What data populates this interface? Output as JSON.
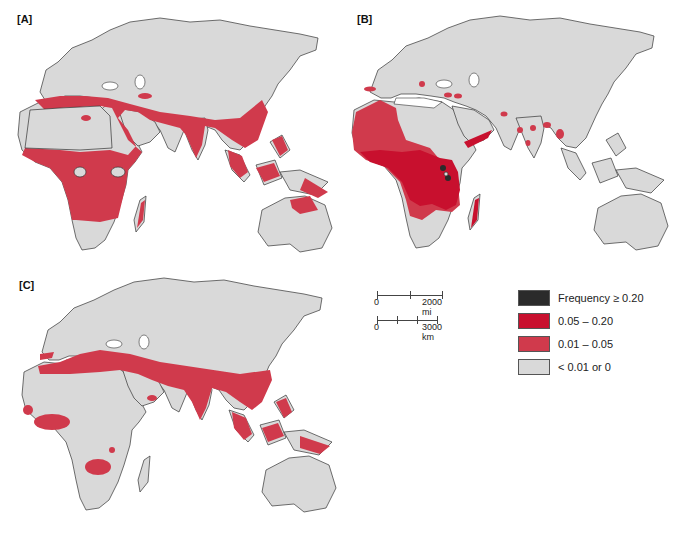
{
  "figure": {
    "panels": [
      {
        "id": "A",
        "label": "[A]"
      },
      {
        "id": "B",
        "label": "[B]"
      },
      {
        "id": "C",
        "label": "[C]"
      }
    ]
  },
  "legend": {
    "items": [
      {
        "label": "Frequency ≥ 0.20",
        "color": "#2b2b2b"
      },
      {
        "label": "0.05 – 0.20",
        "color": "#c8102e"
      },
      {
        "label": "0.01 – 0.05",
        "color": "#d03a4c"
      },
      {
        "label": "< 0.01 or 0",
        "color": "#d9d9d9"
      }
    ]
  },
  "scale_bar": {
    "miles": {
      "start": "0",
      "end": "2000 mi"
    },
    "km": {
      "start": "0",
      "end": "3000 km"
    }
  },
  "colors": {
    "land": "#d9d9d9",
    "outline": "#333333",
    "high": "#2b2b2b",
    "mid": "#c8102e",
    "low": "#d03a4c"
  }
}
